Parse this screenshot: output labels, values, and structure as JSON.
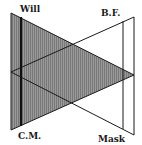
{
  "diagram": {
    "labels": {
      "will": "Will",
      "bf": "B.F.",
      "cm": "C.M.",
      "mask": "Mask"
    },
    "colors": {
      "shade": "#8a8a8a",
      "line": "#1a1a1a",
      "background": "#ffffff"
    }
  }
}
